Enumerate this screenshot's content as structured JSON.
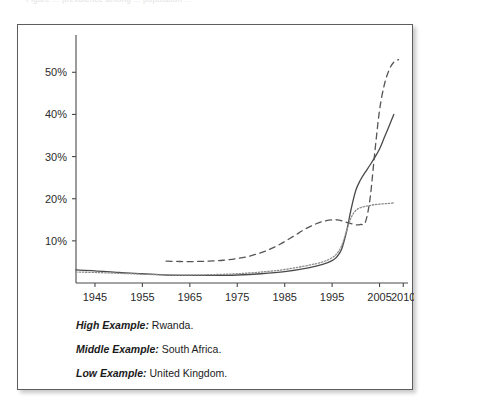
{
  "top_cut_text": "Figure   ...   prevalence   among   ...   population   ...",
  "figure": {
    "legend": [
      {
        "key": "High Example:",
        "value": "Rwanda."
      },
      {
        "key": "Middle Example:",
        "value": "South Africa."
      },
      {
        "key": "Low Example:",
        "value": "United Kingdom."
      }
    ]
  },
  "colors": {
    "panel_border": "#5d5d5d",
    "axis": "#4a4a4a",
    "series_high": "#555555",
    "series_middle": "#4a4a4a",
    "series_low": "#8d8d8d",
    "text": "#1b1b1b"
  },
  "chart_data": {
    "type": "line",
    "title": "",
    "xlabel": "",
    "ylabel": "",
    "xlim": [
      1941,
      2011
    ],
    "ylim": [
      0,
      56
    ],
    "grid": false,
    "legend_position": "below-plot",
    "xticks": [
      1945,
      1955,
      1965,
      1975,
      1985,
      1995,
      2005,
      2010
    ],
    "xtick_labels": [
      "1945",
      "1955",
      "1965",
      "1975",
      "1985",
      "1995",
      "2005",
      "2010"
    ],
    "yticks": [
      10,
      20,
      30,
      40,
      50
    ],
    "ytick_labels": [
      "10%",
      "20%",
      "30%",
      "40%",
      "50%"
    ],
    "series": [
      {
        "name": "Rwanda",
        "legend_label": "High Example: Rwanda.",
        "style": "dashed",
        "x": [
          1960,
          1963,
          1966,
          1969,
          1972,
          1975,
          1978,
          1981,
          1984,
          1987,
          1990,
          1993,
          1996,
          1998,
          2000,
          2001,
          2002,
          2003,
          2004,
          2005,
          2006,
          2007,
          2008,
          2009
        ],
        "values": [
          5.2,
          5.1,
          5.1,
          5.2,
          5.4,
          5.8,
          6.5,
          7.6,
          9.2,
          11.2,
          13.2,
          14.6,
          15.0,
          14.4,
          13.8,
          13.9,
          14.4,
          20.0,
          31.0,
          41.0,
          47.0,
          50.5,
          52.4,
          53.0
        ]
      },
      {
        "name": "South Africa",
        "legend_label": "Middle Example: South Africa.",
        "style": "solid",
        "x": [
          1941,
          1945,
          1950,
          1955,
          1960,
          1965,
          1970,
          1975,
          1980,
          1985,
          1990,
          1993,
          1995,
          1996,
          1997,
          1998,
          1999,
          2000,
          2001,
          2002,
          2003,
          2004,
          2005,
          2006,
          2007,
          2008
        ],
        "values": [
          3.1,
          2.9,
          2.5,
          2.2,
          1.9,
          1.8,
          1.8,
          1.9,
          2.2,
          2.7,
          3.6,
          4.4,
          5.3,
          6.2,
          8.0,
          12.0,
          17.5,
          22.0,
          24.5,
          26.3,
          28.0,
          29.8,
          31.8,
          34.5,
          37.2,
          40.0
        ]
      },
      {
        "name": "United Kingdom",
        "legend_label": "Low Example: United Kingdom.",
        "style": "dotted",
        "x": [
          1941,
          1945,
          1950,
          1955,
          1960,
          1965,
          1970,
          1975,
          1980,
          1985,
          1990,
          1993,
          1995,
          1996,
          1997,
          1998,
          1999,
          2000,
          2001,
          2002,
          2003,
          2004,
          2005,
          2006,
          2007,
          2008
        ],
        "values": [
          2.6,
          2.5,
          2.3,
          2.1,
          1.9,
          1.9,
          2.0,
          2.2,
          2.6,
          3.2,
          4.2,
          5.0,
          6.0,
          7.0,
          8.8,
          12.2,
          15.5,
          17.2,
          17.9,
          18.2,
          18.4,
          18.6,
          18.7,
          18.8,
          18.9,
          19.0
        ]
      }
    ]
  }
}
